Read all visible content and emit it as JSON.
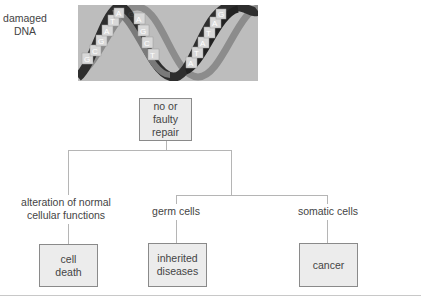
{
  "dna": {
    "label": "damaged DNA",
    "label_line1": "damaged",
    "label_line2": "DNA",
    "strand_letters": [
      "G",
      "C",
      "C",
      "G",
      "A",
      "T",
      "A",
      "G",
      "A",
      "T",
      "G",
      "C",
      "T",
      "A",
      "A",
      "T",
      "T",
      "A",
      "T",
      "A",
      "G",
      "C"
    ]
  },
  "nodes": {
    "repair": {
      "line1": "no or",
      "line2": "faulty",
      "line3": "repair"
    },
    "alteration": {
      "line1": "alteration of normal",
      "line2": "cellular functions"
    },
    "germ": {
      "label": "germ cells"
    },
    "somatic": {
      "label": "somatic cells"
    },
    "cell_death": {
      "line1": "cell",
      "line2": "death"
    },
    "inherited": {
      "line1": "inherited",
      "line2": "diseases"
    },
    "cancer": {
      "label": "cancer"
    }
  },
  "colors": {
    "box_fill": "#ececec",
    "box_border": "#8a8a8a",
    "connector": "#b5b5b5",
    "text": "#444444"
  }
}
